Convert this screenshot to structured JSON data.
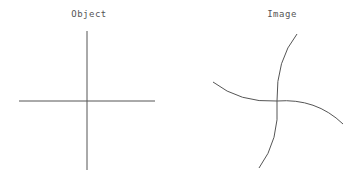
{
  "panels": {
    "object": {
      "title": "Object"
    },
    "image": {
      "title": "Image"
    }
  },
  "colors": {
    "line": "#555555",
    "background": "#ffffff"
  }
}
